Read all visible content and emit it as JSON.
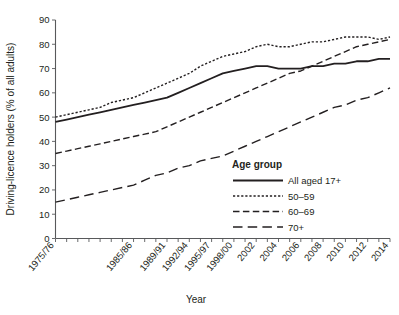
{
  "chart_data": {
    "type": "line",
    "title": "",
    "xlabel": "Year",
    "ylabel": "Driving-licence holders (% of all adults)",
    "ylim": [
      0,
      90
    ],
    "ytick_step": 10,
    "yticks": [
      "0",
      "10",
      "20",
      "30",
      "40",
      "50",
      "60",
      "70",
      "80",
      "90"
    ],
    "grid": false,
    "legend_position": "inside-right",
    "legend_title": "Age group",
    "x": [
      "1975/76",
      "1976/78",
      "1978/79",
      "1979/81",
      "1981/82",
      "1982/84",
      "1984/85",
      "1985/86",
      "1986/88",
      "1988/89",
      "1989/91",
      "1991/92",
      "1992/94",
      "1994/95",
      "1995/97",
      "1997/98",
      "1998/00",
      "2000/01",
      "2002",
      "2003",
      "2004",
      "2005",
      "2006",
      "2007",
      "2008",
      "2009",
      "2010",
      "2011",
      "2012",
      "2013",
      "2014"
    ],
    "xtick_labels": [
      {
        "index": 0,
        "label": "1975/76"
      },
      {
        "index": 7,
        "label": "1985/86"
      },
      {
        "index": 10,
        "label": "1989/91"
      },
      {
        "index": 12,
        "label": "1992/94"
      },
      {
        "index": 14,
        "label": "1995/97"
      },
      {
        "index": 16,
        "label": "1998/00"
      },
      {
        "index": 18,
        "label": "2002"
      },
      {
        "index": 20,
        "label": "2004"
      },
      {
        "index": 22,
        "label": "2006"
      },
      {
        "index": 24,
        "label": "2008"
      },
      {
        "index": 26,
        "label": "2010"
      },
      {
        "index": 28,
        "label": "2012"
      },
      {
        "index": 30,
        "label": "2014"
      }
    ],
    "series": [
      {
        "name": "All aged 17+",
        "style": "solid",
        "values": [
          48,
          49,
          50,
          51,
          52,
          53,
          54,
          55,
          56,
          57,
          58,
          60,
          62,
          64,
          66,
          68,
          69,
          70,
          71,
          71,
          70,
          70,
          70,
          71,
          71,
          72,
          72,
          73,
          73,
          74,
          74
        ]
      },
      {
        "name": "50–59",
        "style": "dotted",
        "values": [
          50,
          51,
          52,
          53,
          54,
          56,
          57,
          58,
          60,
          62,
          64,
          66,
          68,
          71,
          73,
          75,
          76,
          77,
          79,
          80,
          79,
          79,
          80,
          81,
          81,
          82,
          83,
          83,
          83,
          82,
          83
        ]
      },
      {
        "name": "60–69",
        "style": "dashed",
        "values": [
          35,
          36,
          37,
          38,
          39,
          40,
          41,
          42,
          43,
          44,
          46,
          48,
          50,
          52,
          54,
          56,
          58,
          60,
          62,
          64,
          66,
          68,
          69,
          71,
          73,
          75,
          77,
          79,
          80,
          81,
          82
        ]
      },
      {
        "name": "70+",
        "style": "longdash",
        "values": [
          15,
          16,
          17,
          18,
          19,
          20,
          21,
          22,
          24,
          26,
          27,
          29,
          30,
          32,
          33,
          34,
          36,
          38,
          40,
          42,
          44,
          46,
          48,
          50,
          52,
          54,
          55,
          57,
          58,
          60,
          62
        ]
      }
    ]
  },
  "legend": {
    "title": "Age group",
    "items": [
      {
        "label": "All aged 17+",
        "style": "solid"
      },
      {
        "label": "50–59",
        "style": "dotted"
      },
      {
        "label": "60–69",
        "style": "dashed"
      },
      {
        "label": "70+",
        "style": "longdash"
      }
    ]
  },
  "axes": {
    "y_title": "Driving-licence holders (% of all adults)",
    "x_title": "Year"
  }
}
